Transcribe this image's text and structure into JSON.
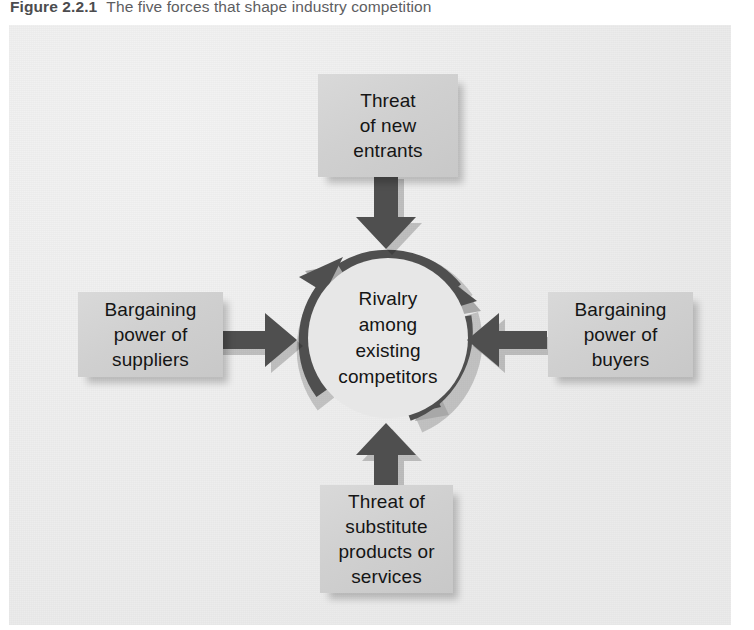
{
  "caption": {
    "figure_number": "Figure 2.2.1",
    "title": "The five forces that shape industry competition"
  },
  "diagram": {
    "type": "porters-five-forces",
    "center": {
      "label": "Rivalry\namong\nexisting\ncompetitors",
      "lines": [
        "Rivalry",
        "among",
        "existing",
        "competitors"
      ]
    },
    "forces": [
      {
        "id": "new-entrants",
        "position": "top",
        "label": "Threat\nof new\nentrants",
        "lines": [
          "Threat",
          "of new",
          "entrants"
        ],
        "arrow_direction": "down"
      },
      {
        "id": "suppliers",
        "position": "left",
        "label": "Bargaining\npower of\nsuppliers",
        "lines": [
          "Bargaining",
          "power of",
          "suppliers"
        ],
        "arrow_direction": "right"
      },
      {
        "id": "buyers",
        "position": "right",
        "label": "Bargaining\npower of\nbuyers",
        "lines": [
          "Bargaining",
          "power of",
          "buyers"
        ],
        "arrow_direction": "left"
      },
      {
        "id": "substitutes",
        "position": "bottom",
        "label": "Threat of\nsubstitute\nproducts or\nservices",
        "lines": [
          "Threat of",
          "substitute",
          "products or",
          "services"
        ],
        "arrow_direction": "up"
      }
    ]
  },
  "colors": {
    "panel_background": "#efefef",
    "box_fill": "#d0d0d0",
    "arrow_fill": "#4f4f4f",
    "ring_fill": "#4f4f4f",
    "ring_inner": "#e7e7e7",
    "text": "#151515",
    "caption_text": "#58585a"
  }
}
